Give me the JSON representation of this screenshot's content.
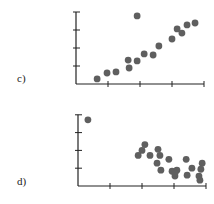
{
  "figure": {
    "panels": [
      {
        "label": "c)",
        "id": "c"
      },
      {
        "label": "d)",
        "id": "d"
      }
    ],
    "dot_color": "#5f5f5f",
    "axis_color": "#222222"
  },
  "chart_data": [
    {
      "type": "scatter",
      "panel": "c)",
      "title": "",
      "xlabel": "",
      "ylabel": "",
      "xticks": 4,
      "yticks": 4,
      "xlim": [
        0,
        4
      ],
      "ylim": [
        0,
        4
      ],
      "grid": false,
      "legend": null,
      "points": [
        [
          0.66,
          0.28
        ],
        [
          0.97,
          0.61
        ],
        [
          1.25,
          0.67
        ],
        [
          1.63,
          1.33
        ],
        [
          1.66,
          0.89
        ],
        [
          1.91,
          1.28
        ],
        [
          2.13,
          1.67
        ],
        [
          2.41,
          1.61
        ],
        [
          2.59,
          2.11
        ],
        [
          1.91,
          3.78
        ],
        [
          3.0,
          2.5
        ],
        [
          3.16,
          3.06
        ],
        [
          3.31,
          2.83
        ],
        [
          3.47,
          3.28
        ],
        [
          3.72,
          3.39
        ]
      ],
      "annotation": "positive linear trend with one outlier high at upper-middle"
    },
    {
      "type": "scatter",
      "panel": "d)",
      "title": "",
      "xlabel": "",
      "ylabel": "",
      "xticks": 4,
      "yticks": 4,
      "xlim": [
        0,
        4
      ],
      "ylim": [
        0,
        4
      ],
      "grid": false,
      "legend": null,
      "points": [
        [
          0.31,
          3.72
        ],
        [
          2.09,
          2.33
        ],
        [
          2.0,
          2.0
        ],
        [
          1.88,
          1.72
        ],
        [
          2.25,
          1.72
        ],
        [
          2.5,
          2.06
        ],
        [
          2.56,
          1.72
        ],
        [
          2.84,
          1.5
        ],
        [
          2.47,
          1.28
        ],
        [
          2.59,
          0.89
        ],
        [
          2.94,
          0.83
        ],
        [
          3.09,
          0.89
        ],
        [
          3.03,
          0.56
        ],
        [
          3.03,
          0.72
        ],
        [
          3.38,
          1.5
        ],
        [
          3.56,
          1.0
        ],
        [
          3.41,
          0.61
        ],
        [
          3.88,
          1.28
        ],
        [
          3.84,
          0.94
        ],
        [
          3.78,
          0.56
        ],
        [
          3.81,
          0.33
        ]
      ],
      "annotation": "negative trend cluster with one outlier at upper-left"
    }
  ]
}
